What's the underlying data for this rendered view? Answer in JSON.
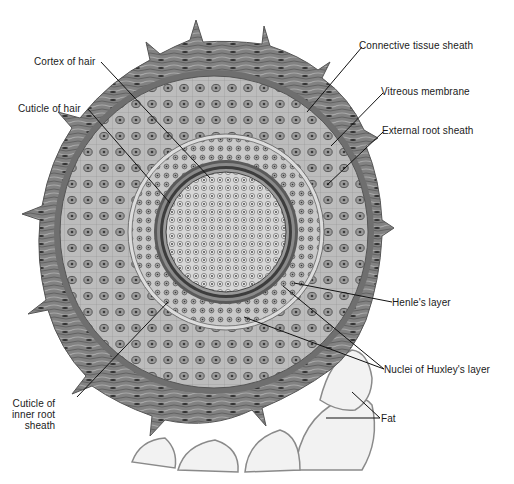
{
  "figure": {
    "labels": [
      {
        "id": "cortex-of-hair",
        "text": "Cortex of hair",
        "x": 34,
        "y": 56,
        "anchor": [
          101,
          62
        ],
        "target": [
          210,
          178
        ]
      },
      {
        "id": "cuticle-of-hair",
        "text": "Cuticle of hair",
        "x": 18,
        "y": 103,
        "anchor": [
          88,
          109
        ],
        "target": [
          170,
          203
        ]
      },
      {
        "id": "connective-tissue-sheath",
        "text": "Connective tissue sheath",
        "x": 359,
        "y": 40,
        "anchor": [
          362,
          47
        ],
        "target": [
          307,
          112
        ]
      },
      {
        "id": "vitreous-membrane",
        "text": "Vitreous membrane",
        "x": 381,
        "y": 86,
        "anchor": [
          383,
          93
        ],
        "target": [
          331,
          146
        ]
      },
      {
        "id": "external-root-sheath",
        "text": "External root sheath",
        "x": 382,
        "y": 125,
        "anchor": [
          383,
          132
        ],
        "target": [
          327,
          185
        ]
      },
      {
        "id": "henles-layer",
        "text": "Henle's layer",
        "x": 392,
        "y": 297,
        "anchor": [
          392,
          302
        ],
        "target": [
          294,
          283
        ]
      },
      {
        "id": "nuclei-of-huxleys-layer",
        "text": "Nuclei of Huxley's layer",
        "x": 384,
        "y": 364,
        "anchor": [
          384,
          369
        ],
        "targets": [
          [
            283,
            286
          ],
          [
            244,
            317
          ]
        ]
      },
      {
        "id": "fat",
        "text": "Fat",
        "x": 381,
        "y": 413,
        "anchor": [
          380,
          418
        ],
        "targets": [
          [
            352,
            392
          ],
          [
            326,
            418
          ]
        ]
      },
      {
        "id": "cuticle-of-inner-root-sheath",
        "lines": [
          "Cuticle of",
          "inner root",
          "sheath"
        ],
        "x": 12,
        "y": 398,
        "anchor": [
          77,
          397
        ],
        "target": [
          168,
          302
        ]
      }
    ]
  },
  "colors": {
    "background": "#ffffff",
    "connective": "#7e7e7e",
    "connective_dark": "#5a5a5a",
    "vitreous": "#6d6d6d",
    "outer_root": "#b9b9b9",
    "inner_root": "#c8c8c8",
    "cuticle_ring": "#3d3d3d",
    "cortex": "#d2d2d2",
    "nucleus": "#4a4a4a",
    "fat": "#f2f2f2",
    "leader": "#111111",
    "text": "#1a1a1a"
  }
}
